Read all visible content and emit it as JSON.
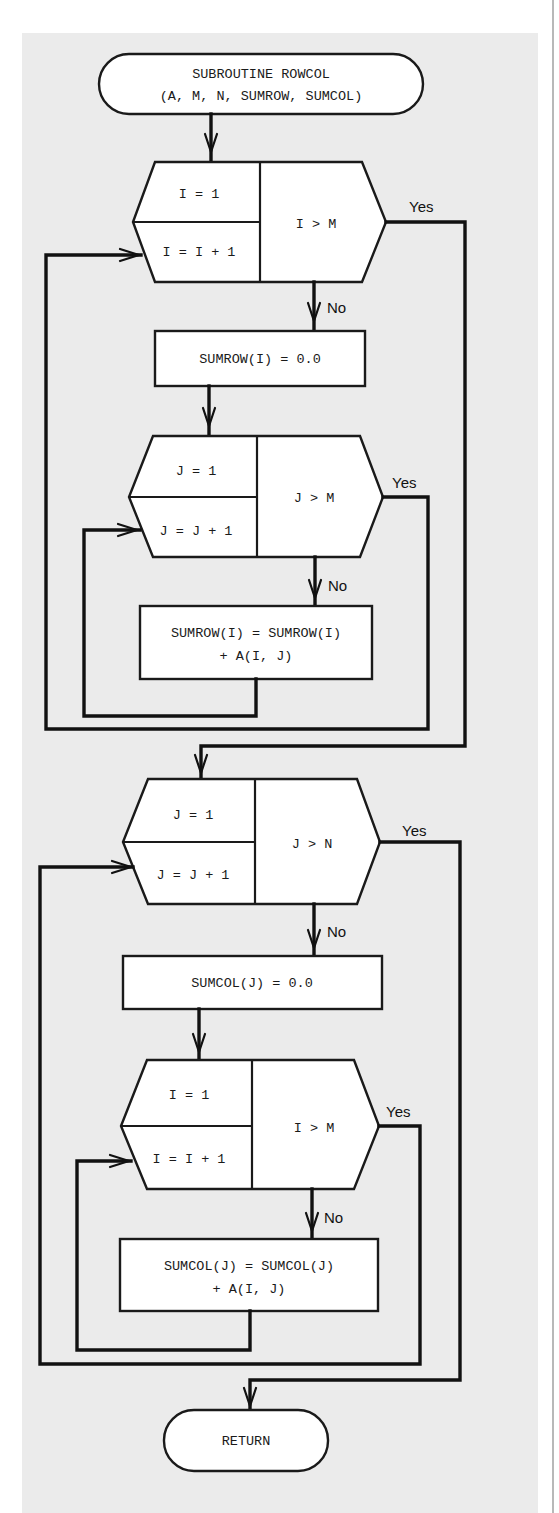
{
  "diagram": {
    "type": "flowchart",
    "title": "SUBROUTINE ROWCOL",
    "colors": {
      "panel": "#ebebeb",
      "shape_fill": "#ffffff",
      "stroke": "#111111"
    },
    "start": {
      "line1": "SUBROUTINE ROWCOL",
      "line2": "(A, M, N, SUMROW, SUMCOL)"
    },
    "loop_i_outer": {
      "init": "I = 1",
      "increment": "I = I + 1",
      "test": "I > M",
      "yes_label": "Yes",
      "no_label": "No"
    },
    "sumrow_init": "SUMROW(I) = 0.0",
    "loop_j_inner": {
      "init": "J = 1",
      "increment": "J = J + 1",
      "test": "J > M",
      "yes_label": "Yes",
      "no_label": "No"
    },
    "sumrow_accumulate": {
      "line1": "SUMROW(I) = SUMROW(I)",
      "line2": "+ A(I, J)"
    },
    "loop_j_outer": {
      "init": "J = 1",
      "increment": "J = J + 1",
      "test": "J > N",
      "yes_label": "Yes",
      "no_label": "No"
    },
    "sumcol_init": "SUMCOL(J) = 0.0",
    "loop_i_inner": {
      "init": "I = 1",
      "increment": "I = I + 1",
      "test": "I > M",
      "yes_label": "Yes",
      "no_label": "No"
    },
    "sumcol_accumulate": {
      "line1": "SUMCOL(J) = SUMCOL(J)",
      "line2": "+ A(I, J)"
    },
    "end": {
      "label": "RETURN"
    }
  }
}
